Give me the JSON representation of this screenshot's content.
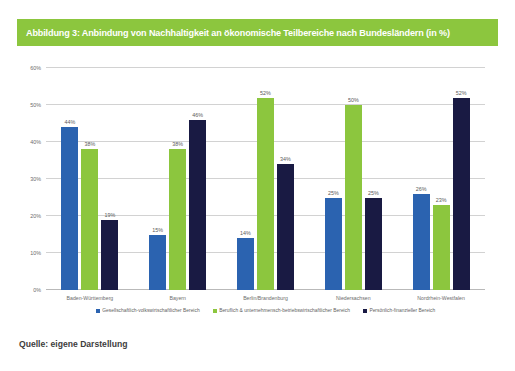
{
  "figure": {
    "title": "Abbildung 3: Anbindung von Nachhaltigkeit an ökonomische Teilbereiche nach Bundesländern (in %)",
    "source": "Quelle: eigene Darstellung",
    "title_bg_color": "#8CC63E",
    "title_text_color": "#FFFFFF"
  },
  "chart_data": {
    "type": "bar",
    "title": "Abbildung 3: Anbindung von Nachhaltigkeit an ökonomische Teilbereiche nach Bundesländern (in %)",
    "xlabel": "",
    "ylabel": "",
    "ylim": [
      0,
      60
    ],
    "ytick_labels": [
      "0%",
      "10%",
      "20%",
      "30%",
      "40%",
      "50%",
      "60%"
    ],
    "ytick_values": [
      0,
      10,
      20,
      30,
      40,
      50,
      60
    ],
    "grid": true,
    "legend_position": "bottom",
    "value_label_suffix": "%",
    "categories": [
      "Baden-Württemberg",
      "Bayern",
      "Berlin/Brandenburg",
      "Niedersachsen",
      "Nordrhein-Westfalen"
    ],
    "series": [
      {
        "name": "Gesellschaftlich-volkswirtschaftlicher Bereich",
        "color": "#2B63B0",
        "values": [
          44,
          15,
          14,
          25,
          26
        ],
        "labels": [
          "44%",
          "15%",
          "14%",
          "25%",
          "26%"
        ]
      },
      {
        "name": "Beruflich & unternehmensch-betriebswirtschaftlicher Bereich",
        "color": "#8CC63E",
        "values": [
          38,
          38,
          52,
          50,
          23
        ],
        "labels": [
          "38%",
          "38%",
          "52%",
          "50%",
          "23%"
        ]
      },
      {
        "name": "Persönlich-finanzieller Bereich",
        "color": "#191A43",
        "values": [
          19,
          46,
          34,
          25,
          52
        ],
        "labels": [
          "19%",
          "46%",
          "34%",
          "25%",
          "52%"
        ]
      }
    ]
  }
}
